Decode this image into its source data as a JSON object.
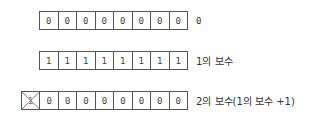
{
  "rows": [
    {
      "name": "zero",
      "bits": [
        "0",
        "0",
        "0",
        "0",
        "0",
        "0",
        "0",
        "0"
      ],
      "label": "0"
    },
    {
      "name": "ones-complement",
      "bits": [
        "1",
        "1",
        "1",
        "1",
        "1",
        "1",
        "1",
        "1"
      ],
      "label": "1의 보수"
    },
    {
      "name": "twos-complement",
      "overflow_bit": "1",
      "overflow_crossed": true,
      "bits": [
        "0",
        "0",
        "0",
        "0",
        "0",
        "0",
        "0",
        "0"
      ],
      "label": "2의 보수(1의 보수 +1)"
    }
  ],
  "colors": {
    "border": "#555555",
    "text": "#333333",
    "cross": "#666666"
  }
}
